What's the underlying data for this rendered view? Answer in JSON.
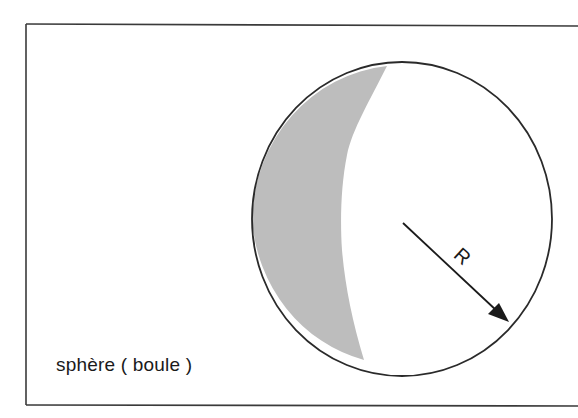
{
  "diagram": {
    "caption": "sphère ( boule )",
    "radius_label": "R",
    "colors": {
      "stroke": "#2a2a2a",
      "shading": "#bdbdbd",
      "background": "#ffffff"
    }
  }
}
